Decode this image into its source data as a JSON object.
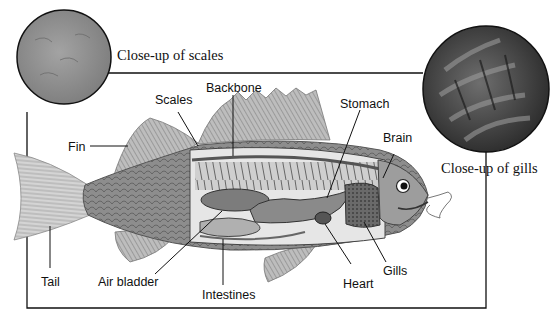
{
  "captions": {
    "scales_closeup": "Close-up of scales",
    "gills_closeup": "Close-up of gills"
  },
  "labels": {
    "fin": "Fin",
    "scales": "Scales",
    "backbone": "Backbone",
    "stomach": "Stomach",
    "brain": "Brain",
    "tail": "Tail",
    "air_bladder": "Air bladder",
    "intestines": "Intestines",
    "heart": "Heart",
    "gills": "Gills"
  },
  "colors": {
    "ink": "#111111",
    "scales_disk": "#8e8e8e",
    "gills_disk": "#3e3e3e",
    "body": "#9a9a9a",
    "organ": "#7a7a7a",
    "cavity": "#e6e6e6"
  }
}
